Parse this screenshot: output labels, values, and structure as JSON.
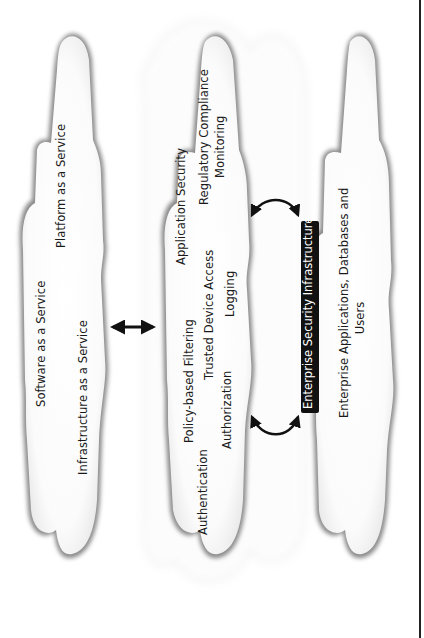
{
  "diagram": {
    "orientation": "rotated 90deg counter-clockwise",
    "clouds": {
      "cloud_services": {
        "items": [
          "Platform as a Service",
          "Software as a Service",
          "Infrastructure as a Service"
        ]
      },
      "security_services": {
        "items": [
          "Application Security",
          "Regulatory Compliance",
          "Monitoring",
          "Policy-based Filtering",
          "Trusted Device Access",
          "Logging",
          "Authentication",
          "Authorization"
        ]
      },
      "enterprise": {
        "line1": "Enterprise Applications, Databases and",
        "line2": "Users"
      }
    },
    "label_box": {
      "text": "Enterprise Security Infrastructure",
      "background": "#111111",
      "color": "#ffffff"
    },
    "connectors": [
      {
        "from": "cloud_services",
        "to": "security_services",
        "type": "double-arrow-straight"
      },
      {
        "from": "label_box",
        "to": "security_services",
        "type": "double-arrow-curved",
        "position": "upper"
      },
      {
        "from": "label_box",
        "to": "security_services",
        "type": "double-arrow-curved",
        "position": "lower"
      }
    ],
    "colors": {
      "cloud_fill": "#ffffff",
      "cloud_edge": "#6a6a6a",
      "arrow": "#111111",
      "border": "#222222"
    }
  }
}
